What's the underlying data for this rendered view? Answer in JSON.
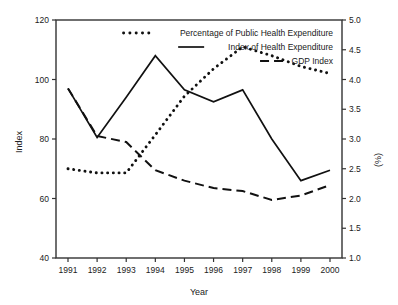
{
  "chart_data": {
    "type": "line",
    "title": "",
    "xlabel": "Year",
    "ylabel": "Index",
    "y2label": "(%)",
    "grid": false,
    "legend_position": "top-right",
    "categories": [
      "1991",
      "1992",
      "1993",
      "1994",
      "1995",
      "1996",
      "1997",
      "1998",
      "1999",
      "2000"
    ],
    "x": [
      1991,
      1992,
      1993,
      1994,
      1995,
      1996,
      1997,
      1998,
      1999,
      2000
    ],
    "ylim": [
      40,
      120
    ],
    "yticks": [
      40,
      60,
      80,
      100,
      120
    ],
    "y2lim": [
      1.0,
      5.0
    ],
    "y2ticks": [
      1.0,
      1.5,
      2.0,
      2.5,
      3.0,
      3.5,
      4.0,
      4.5,
      5.0
    ],
    "series": [
      {
        "name": "Percentage of Public Health Expenditure",
        "style": "dotted",
        "axis": "right",
        "units": "%",
        "values": [
          2.5,
          2.43,
          2.43,
          3.07,
          3.72,
          4.18,
          4.55,
          4.4,
          4.22,
          4.1
        ]
      },
      {
        "name": "Index of Health Expenditure",
        "style": "solid",
        "axis": "left",
        "units": "index",
        "values": [
          97,
          80.5,
          94,
          108,
          96.5,
          92.5,
          96.5,
          80,
          66,
          69.5
        ]
      },
      {
        "name": "GDP Index",
        "style": "dashed",
        "axis": "left",
        "units": "index",
        "values": [
          97,
          81,
          79,
          69.5,
          66,
          63.5,
          62.5,
          59.5,
          61,
          64.5
        ]
      }
    ],
    "series_right_detail": {
      "percentage_by_year": [
        {
          "year": "1991",
          "value": 2.5
        },
        {
          "year": "1992",
          "value": 2.43
        },
        {
          "year": "1993",
          "value": 2.43
        },
        {
          "year": "1994",
          "value": 4.55
        },
        {
          "year": "1995",
          "value": 4.4
        },
        {
          "year": "1996",
          "value": 4.1
        },
        {
          "year": "1997",
          "value": 4.32
        },
        {
          "year": "1998",
          "value": 3.55
        },
        {
          "year": "1999",
          "value": 2.7
        },
        {
          "year": "2000",
          "value": 2.7
        }
      ]
    }
  },
  "legend": {
    "items": [
      {
        "label": "Percentage of Public Health Expenditure",
        "style": "dotted"
      },
      {
        "label": "Index of Health Expenditure",
        "style": "solid"
      },
      {
        "label": "GDP Index",
        "style": "dashed"
      }
    ]
  },
  "axes": {
    "left": {
      "title": "Index",
      "ticks": [
        "120",
        "100",
        "80",
        "60",
        "40"
      ]
    },
    "right": {
      "title": "(%)",
      "ticks": [
        "5.0",
        "4.5",
        "4.0",
        "3.5",
        "3.0",
        "2.5",
        "2.0",
        "1.5",
        "1.0"
      ]
    },
    "bottom": {
      "title": "Year",
      "ticks": [
        "1991",
        "1992",
        "1993",
        "1994",
        "1995",
        "1996",
        "1997",
        "1998",
        "1999",
        "2000"
      ]
    }
  },
  "colors": {
    "ink": "#111111",
    "frame": "#333333",
    "background": "#ffffff"
  }
}
